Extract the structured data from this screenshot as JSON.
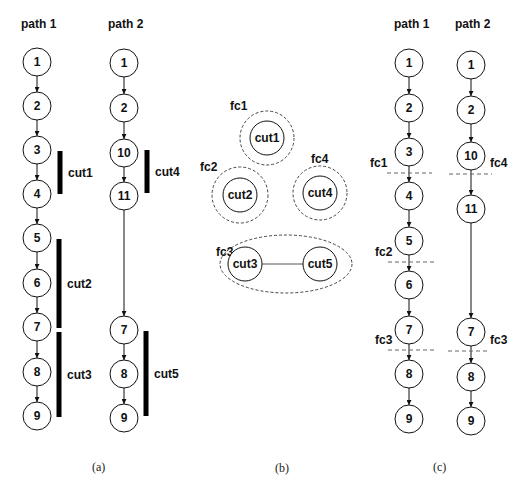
{
  "panel_a": {
    "caption": "(a)",
    "path1": {
      "title": "path 1",
      "nodes": [
        {
          "label": "1",
          "x": 37,
          "y": 62
        },
        {
          "label": "2",
          "x": 37,
          "y": 106
        },
        {
          "label": "3",
          "x": 37,
          "y": 150
        },
        {
          "label": "4",
          "x": 37,
          "y": 194
        },
        {
          "label": "5",
          "x": 37,
          "y": 238
        },
        {
          "label": "6",
          "x": 37,
          "y": 283
        },
        {
          "label": "7",
          "x": 37,
          "y": 327
        },
        {
          "label": "8",
          "x": 37,
          "y": 372
        },
        {
          "label": "9",
          "x": 37,
          "y": 416
        }
      ]
    },
    "path2": {
      "title": "path 2",
      "nodes": [
        {
          "label": "1",
          "x": 124,
          "y": 63
        },
        {
          "label": "2",
          "x": 124,
          "y": 108
        },
        {
          "label": "10",
          "x": 124,
          "y": 153
        },
        {
          "label": "11",
          "x": 124,
          "y": 196
        },
        {
          "label": "7",
          "x": 124,
          "y": 330
        },
        {
          "label": "8",
          "x": 124,
          "y": 374
        },
        {
          "label": "9",
          "x": 124,
          "y": 418
        }
      ]
    },
    "cuts": [
      {
        "label": "cut1",
        "x": 60,
        "y1": 151,
        "y2": 194
      },
      {
        "label": "cut2",
        "x": 59,
        "y1": 239,
        "y2": 328
      },
      {
        "label": "cut3",
        "x": 59,
        "y1": 332,
        "y2": 417
      },
      {
        "label": "cut4",
        "x": 147,
        "y1": 150,
        "y2": 193
      },
      {
        "label": "cut5",
        "x": 146,
        "y1": 331,
        "y2": 416
      }
    ]
  },
  "panel_b": {
    "caption": "(b)",
    "groups": [
      {
        "label": "fc1",
        "cx": 267,
        "cy": 138,
        "rx": 27,
        "ry": 27,
        "members": [
          {
            "label": "cut1",
            "x": 267,
            "y": 138
          }
        ]
      },
      {
        "label": "fc2",
        "cx": 240,
        "cy": 195,
        "rx": 28,
        "ry": 28,
        "members": [
          {
            "label": "cut2",
            "x": 240,
            "y": 195
          }
        ]
      },
      {
        "label": "fc4",
        "cx": 320,
        "cy": 193,
        "rx": 27,
        "ry": 27,
        "members": [
          {
            "label": "cut4",
            "x": 320,
            "y": 193
          }
        ]
      },
      {
        "label": "fc3",
        "cx": 286,
        "cy": 264,
        "rx": 66,
        "ry": 29,
        "members": [
          {
            "label": "cut3",
            "x": 245,
            "y": 264
          },
          {
            "label": "cut5",
            "x": 320,
            "y": 264
          }
        ]
      }
    ],
    "edges": [
      {
        "from": "cut3",
        "to": "cut5"
      }
    ]
  },
  "panel_c": {
    "caption": "(c)",
    "path1": {
      "title": "path 1",
      "nodes": [
        {
          "label": "1",
          "x": 409,
          "y": 63
        },
        {
          "label": "2",
          "x": 409,
          "y": 108
        },
        {
          "label": "3",
          "x": 409,
          "y": 152
        },
        {
          "label": "4",
          "x": 409,
          "y": 196
        },
        {
          "label": "5",
          "x": 409,
          "y": 241
        },
        {
          "label": "6",
          "x": 409,
          "y": 285
        },
        {
          "label": "7",
          "x": 409,
          "y": 330
        },
        {
          "label": "8",
          "x": 409,
          "y": 374
        },
        {
          "label": "9",
          "x": 409,
          "y": 419
        }
      ]
    },
    "path2": {
      "title": "path 2",
      "nodes": [
        {
          "label": "1",
          "x": 471,
          "y": 65
        },
        {
          "label": "2",
          "x": 471,
          "y": 110
        },
        {
          "label": "10",
          "x": 471,
          "y": 156
        },
        {
          "label": "11",
          "x": 471,
          "y": 209
        },
        {
          "label": "7",
          "x": 471,
          "y": 332
        },
        {
          "label": "8",
          "x": 471,
          "y": 377
        },
        {
          "label": "9",
          "x": 471,
          "y": 421
        }
      ]
    },
    "cutlines": [
      {
        "label": "fc1",
        "x1": 387,
        "x2": 432,
        "y": 173,
        "lx": 370,
        "ly": 167
      },
      {
        "label": "fc4",
        "x1": 449,
        "x2": 492,
        "y": 174,
        "lx": 490,
        "ly": 167
      },
      {
        "label": "fc2",
        "x1": 388,
        "x2": 434,
        "y": 262,
        "lx": 375,
        "ly": 256
      },
      {
        "label": "fc3",
        "x1": 388,
        "x2": 434,
        "y": 350,
        "lx": 375,
        "ly": 344
      },
      {
        "label": "fc3",
        "x1": 448,
        "x2": 490,
        "y": 351,
        "lx": 490,
        "ly": 344
      }
    ]
  },
  "style": {
    "stroke": "#111111",
    "dash_color": "#666666"
  }
}
